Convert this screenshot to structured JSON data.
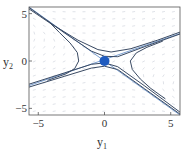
{
  "chart_data": {
    "type": "line",
    "title": "",
    "subtitle": "",
    "xlabel": "y1",
    "ylabel": "y2",
    "xlabel_main": "y",
    "xlabel_sub": "1",
    "ylabel_main": "y",
    "ylabel_sub": "2",
    "xlim": [
      -5.7,
      5.7
    ],
    "ylim": [
      -5.7,
      5.7
    ],
    "grid": false,
    "legend": "none",
    "x_ticks": [
      {
        "value": -5,
        "label": "−5"
      },
      {
        "value": 0,
        "label": "0"
      },
      {
        "value": 5,
        "label": "5"
      }
    ],
    "y_ticks": [
      {
        "value": -5,
        "label": "−5"
      },
      {
        "value": 0,
        "label": "0"
      },
      {
        "value": 5,
        "label": "5"
      }
    ],
    "equilibrium_point": {
      "x": 0,
      "y": 0,
      "color": "#1f5bbf",
      "label": "saddle point"
    },
    "vector_field": {
      "color": "#c9cfd8",
      "description": "direction field arrows, faint gray",
      "grid_step": 0.75
    },
    "series": [
      {
        "name": "separatrix-1",
        "color": "#7a9fd1",
        "width": 1,
        "points": [
          [
            -5.7,
            5.7
          ],
          [
            5.7,
            -5.7
          ]
        ]
      },
      {
        "name": "separatrix-2",
        "color": "#7a9fd1",
        "width": 1,
        "points": [
          [
            -5.7,
            -2.6
          ],
          [
            5.7,
            2.9
          ]
        ]
      },
      {
        "name": "trajectory-upper",
        "color": "#3a4a63",
        "width": 1,
        "points": [
          [
            -5.7,
            5.5
          ],
          [
            -4,
            3.9
          ],
          [
            -2,
            2.2
          ],
          [
            -0.5,
            1.2
          ],
          [
            0.5,
            0.95
          ],
          [
            2,
            1.3
          ],
          [
            4,
            2.2
          ],
          [
            5.7,
            3.05
          ]
        ]
      },
      {
        "name": "trajectory-upper-2",
        "color": "#3a4a63",
        "width": 1,
        "points": [
          [
            -5.7,
            5.65
          ],
          [
            -3,
            2.95
          ],
          [
            -1,
            1.05
          ],
          [
            0,
            0.5
          ],
          [
            1,
            0.45
          ],
          [
            3,
            1.5
          ],
          [
            5.7,
            2.85
          ]
        ]
      },
      {
        "name": "trajectory-lower",
        "color": "#3a4a63",
        "width": 1,
        "points": [
          [
            -5.7,
            -2.75
          ],
          [
            -3,
            -1.6
          ],
          [
            -1,
            -0.75
          ],
          [
            0,
            -0.55
          ],
          [
            1,
            -0.9
          ],
          [
            3,
            -2.9
          ],
          [
            5.7,
            -5.6
          ]
        ]
      },
      {
        "name": "trajectory-lower-2",
        "color": "#3a4a63",
        "width": 1,
        "points": [
          [
            -5.7,
            -2.45
          ],
          [
            -3,
            -1.25
          ],
          [
            -1,
            -0.35
          ],
          [
            0,
            -0.2
          ],
          [
            1,
            -0.6
          ],
          [
            3,
            -2.6
          ],
          [
            5.7,
            -5.4
          ]
        ]
      },
      {
        "name": "trajectory-left",
        "color": "#3a4a63",
        "width": 1,
        "points": [
          [
            -4.3,
            4.3
          ],
          [
            -3.4,
            3.0
          ],
          [
            -2.6,
            1.9
          ],
          [
            -2.05,
            0.9
          ],
          [
            -1.95,
            0.0
          ],
          [
            -2.25,
            -0.8
          ],
          [
            -2.9,
            -1.35
          ],
          [
            -4.3,
            -2.05
          ]
        ]
      },
      {
        "name": "trajectory-right",
        "color": "#3a4a63",
        "width": 1,
        "points": [
          [
            4.4,
            2.1
          ],
          [
            3.2,
            1.45
          ],
          [
            2.4,
            0.85
          ],
          [
            1.95,
            0.0
          ],
          [
            2.1,
            -0.9
          ],
          [
            2.7,
            -1.9
          ],
          [
            3.5,
            -2.9
          ],
          [
            4.6,
            -4.0
          ]
        ]
      }
    ]
  }
}
